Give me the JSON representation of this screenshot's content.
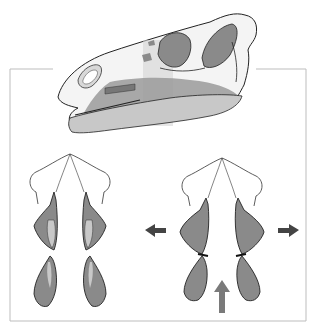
{
  "figure": {
    "title": "",
    "panels": [
      {
        "id": "skull",
        "description": "Lateral view of skull with shaded maxilla/jaw regions"
      },
      {
        "id": "rest",
        "description": "Palatal/ventral schematic, jaws at rest"
      },
      {
        "id": "chewing",
        "description": "Palatal/ventral schematic, maxillae rotating outward during occlusion"
      }
    ],
    "arrows": [
      {
        "id": "left-outward",
        "direction": "left",
        "color": "#444444"
      },
      {
        "id": "right-outward",
        "direction": "right",
        "color": "#444444"
      },
      {
        "id": "upward",
        "direction": "up",
        "color": "#7a7a7a"
      }
    ],
    "colors": {
      "frame": "#bdbdbd",
      "bone_fill": "#f4f4f4",
      "outline": "#222222",
      "shaded": "#8a8a8a",
      "light_shade": "#c8c8c8",
      "band": "#d2d2d2"
    }
  }
}
